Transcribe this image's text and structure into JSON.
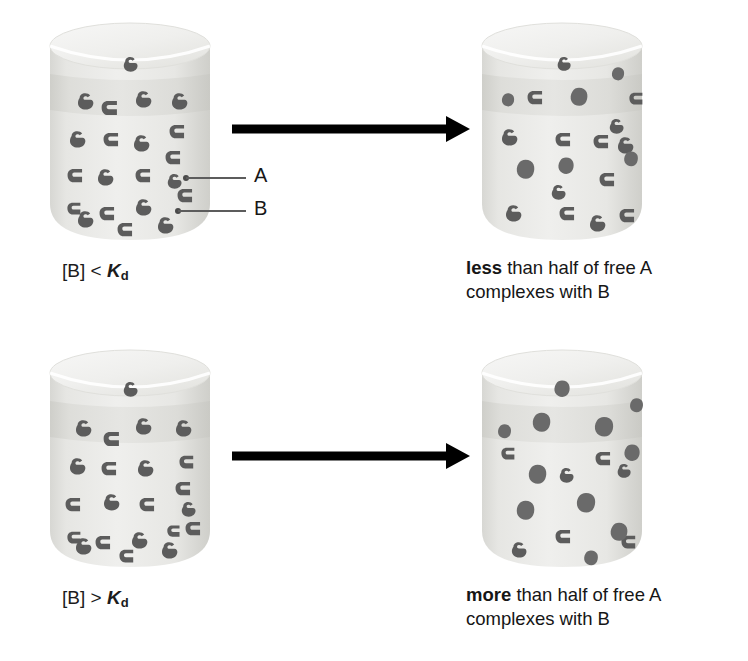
{
  "figure": {
    "type": "diagram",
    "colors": {
      "molecule": "#5c5c5c",
      "complex": "#6a6a6a",
      "beaker_body": "#e9e9e6",
      "beaker_liquid_band": "#dcdcd8",
      "beaker_top": "#f1f1ef",
      "arrow": "#000000",
      "callout_line": "#5c5c5c",
      "text": "#161616",
      "background": "#ffffff"
    },
    "legend": {
      "a_label": "A",
      "a_description": "small free ligand molecule",
      "b_label": "B",
      "b_description": "larger binding partner molecule"
    }
  },
  "rows": [
    {
      "id": "low-concentration",
      "condition_label": {
        "bracket_open": "[",
        "species": "B",
        "bracket_close": "]",
        "operator": "<",
        "constant": "K",
        "constant_subscript": "d",
        "full_text": "[B] < Kd"
      },
      "arrow": {
        "name": "reaction-arrow",
        "direction": "right"
      },
      "result_caption": {
        "emphasis": "less",
        "rest_line1": " than half of free A",
        "line2": "complexes with B",
        "full_text": "less than half of free A complexes with B"
      },
      "beaker_before": {
        "name": "beaker-low-before",
        "free_a_count": 11,
        "free_b_count": 10,
        "complex_count": 0
      },
      "beaker_after": {
        "name": "beaker-low-after",
        "free_a_count": 7,
        "free_b_count": 7,
        "complex_count": 6
      }
    },
    {
      "id": "high-concentration",
      "condition_label": {
        "bracket_open": "[",
        "species": "B",
        "bracket_close": "]",
        "operator": ">",
        "constant": "K",
        "constant_subscript": "d",
        "full_text": "[B] > Kd"
      },
      "arrow": {
        "name": "reaction-arrow",
        "direction": "right"
      },
      "result_caption": {
        "emphasis": "more",
        "rest_line1": " than half of free A",
        "line2": "complexes with B",
        "full_text": "more than half of free A complexes with B"
      },
      "beaker_before": {
        "name": "beaker-high-before",
        "free_a_count": 11,
        "free_b_count": 11,
        "complex_count": 0
      },
      "beaker_after": {
        "name": "beaker-high-after",
        "free_a_count": 3,
        "free_b_count": 4,
        "complex_count": 11
      }
    }
  ]
}
